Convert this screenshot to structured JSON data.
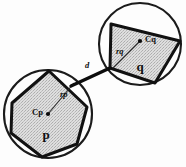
{
  "figure": {
    "background_color": "#fdfdfd",
    "ink_color": "#111111",
    "fill_color": "#d8d8d8"
  },
  "shapes": {
    "lower": {
      "polygon_label": "p",
      "center_label": "Cp",
      "radius_label": "rp",
      "circle": {
        "cx": 48,
        "cy": 114,
        "r": 44
      },
      "center_point": {
        "x": 48,
        "y": 114
      },
      "radius_endpoint": {
        "x": 74,
        "y": 83
      },
      "vertices": [
        {
          "x": 49,
          "y": 71
        },
        {
          "x": 87,
          "y": 107
        },
        {
          "x": 77,
          "y": 144
        },
        {
          "x": 42,
          "y": 157
        },
        {
          "x": 11,
          "y": 133
        },
        {
          "x": 12,
          "y": 103
        }
      ]
    },
    "upper": {
      "polygon_label": "q",
      "center_label": "Cq",
      "radius_label": "rq",
      "circle": {
        "cx": 140,
        "cy": 44,
        "r": 41
      },
      "center_point": {
        "x": 140,
        "y": 41
      },
      "radius_endpoint": {
        "x": 113,
        "y": 68
      },
      "vertices": [
        {
          "x": 111,
          "y": 24
        },
        {
          "x": 180,
          "y": 41
        },
        {
          "x": 155,
          "y": 83
        },
        {
          "x": 110,
          "y": 68
        }
      ]
    }
  },
  "distance": {
    "label": "d",
    "from": {
      "x": 71,
      "y": 86
    },
    "to": {
      "x": 110,
      "y": 68
    },
    "label_pos": {
      "x": 87,
      "y": 66
    }
  },
  "labels": {
    "lower_shape": {
      "text": "p",
      "x": 46,
      "y": 136
    },
    "lower_center": {
      "text": "Cp",
      "x": 32,
      "y": 113
    },
    "lower_radius": {
      "text": "rp",
      "x": 60,
      "y": 95
    },
    "upper_shape": {
      "text": "q",
      "x": 140,
      "y": 68
    },
    "upper_center": {
      "text": "Cq",
      "x": 145,
      "y": 40
    },
    "upper_radius": {
      "text": "rq",
      "x": 116,
      "y": 52
    },
    "distance": {
      "text": "d",
      "x": 87,
      "y": 66
    }
  }
}
